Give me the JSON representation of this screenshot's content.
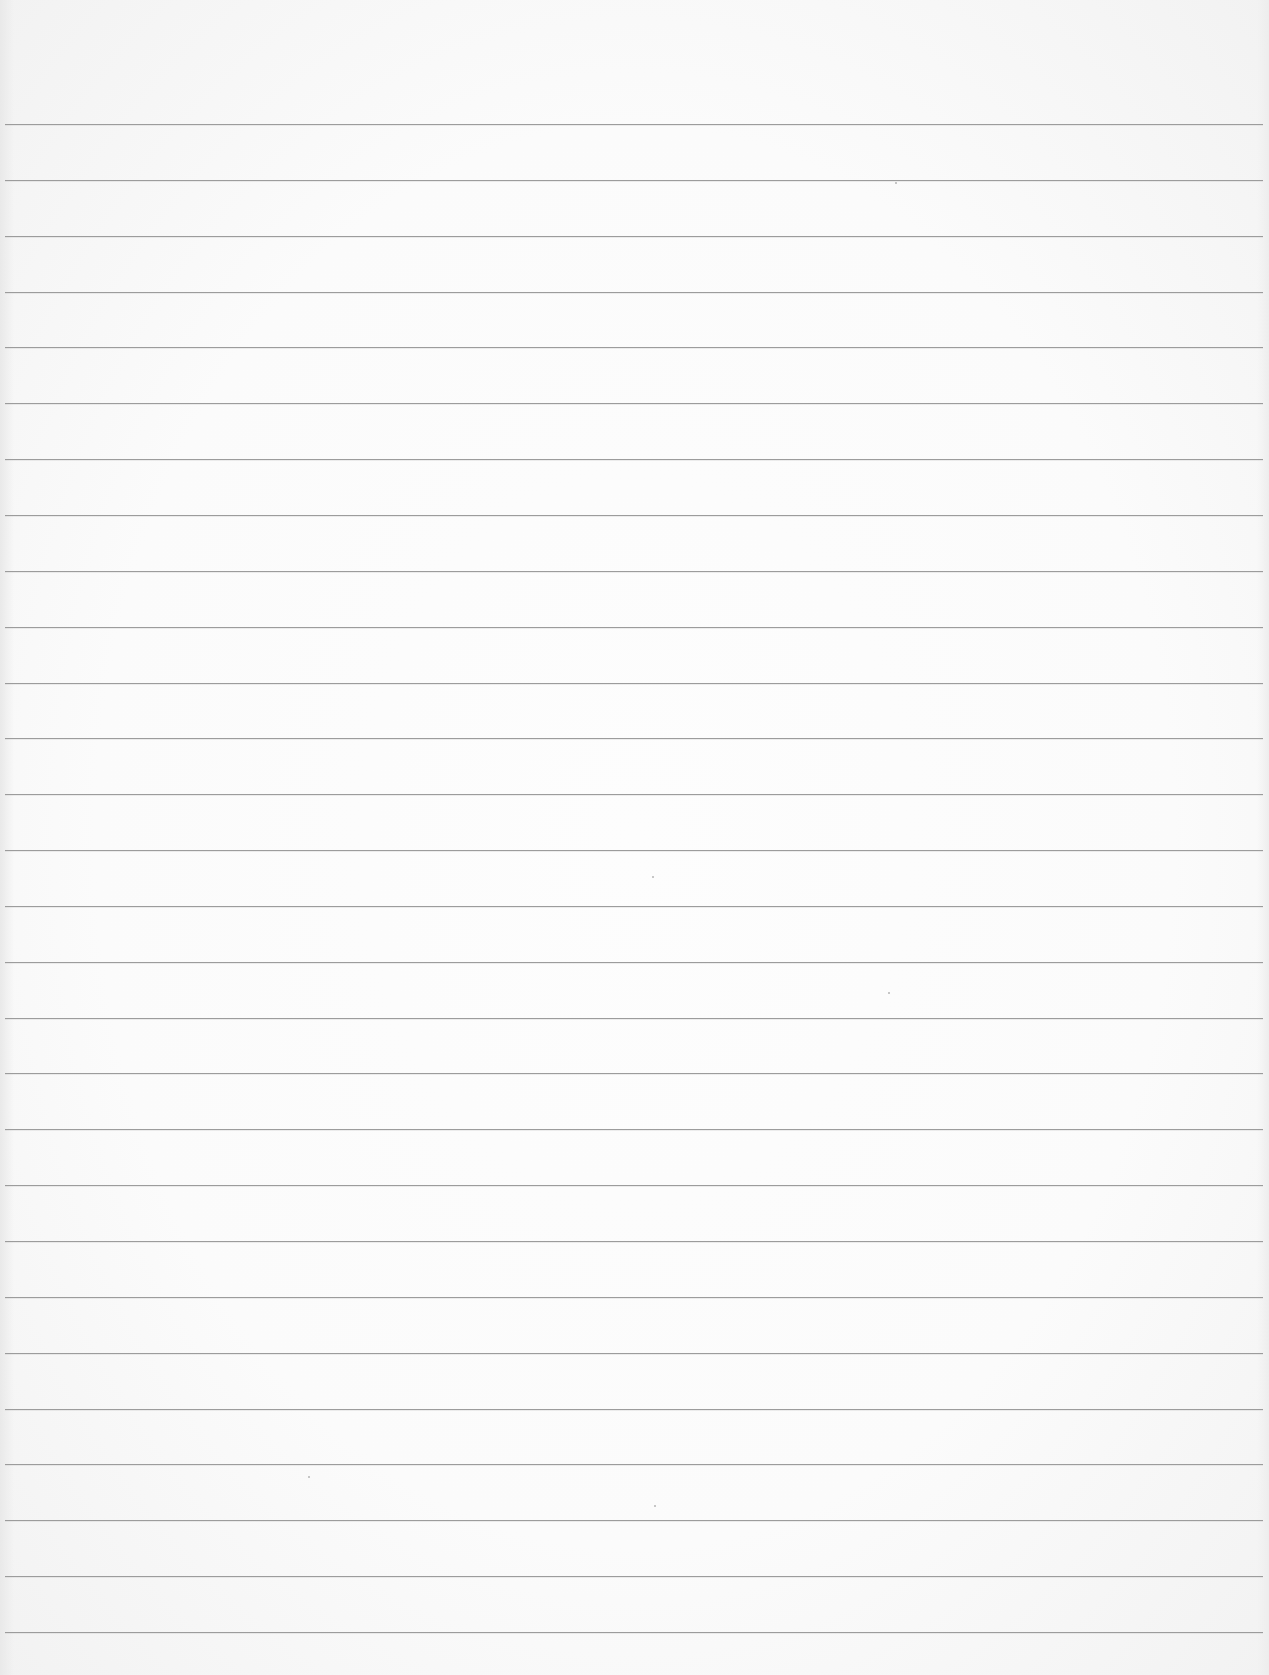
{
  "document": {
    "type": "blank lined paper",
    "width": 1269,
    "height": 1675,
    "colors": {
      "paper": "#fafafa",
      "rule": "#9c9c9c"
    },
    "rules": {
      "count": 28,
      "first_y": 124,
      "spacing": 55.85,
      "x_start": 5,
      "x_end": 1263
    }
  }
}
